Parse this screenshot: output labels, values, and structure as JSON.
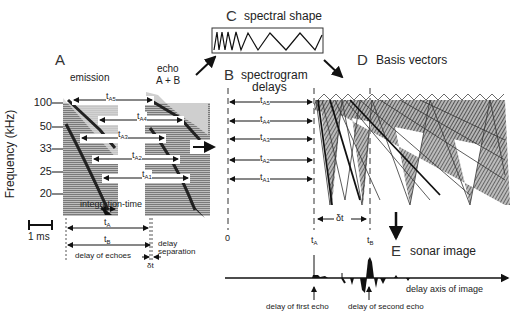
{
  "panels": {
    "A": {
      "letter": "A",
      "emission_label": "emission",
      "echo_label_1": "echo",
      "echo_label_2": "A + B",
      "y_axis_label": "Frequency (kHz)",
      "y_ticks": [
        "100",
        "50",
        "33",
        "25",
        "20"
      ],
      "delay_labels": [
        {
          "t": "t",
          "sub": "A5"
        },
        {
          "t": "t",
          "sub": "A4"
        },
        {
          "t": "t",
          "sub": "A3"
        },
        {
          "t": "t",
          "sub": "A2"
        },
        {
          "t": "t",
          "sub": "A1"
        }
      ],
      "integration_time": "integration-time",
      "scale_bar": "1 ms",
      "tA": {
        "t": "t",
        "sub": "A"
      },
      "tB": {
        "t": "t",
        "sub": "B"
      },
      "delay_of_echoes": "delay of echoes",
      "delay_separation_1": "delay",
      "delay_separation_2": "separation",
      "delta_t": "δt"
    },
    "B": {
      "letter": "B",
      "title_1": "spectrogram",
      "title_2": "delays",
      "delay_labels": [
        {
          "t": "t",
          "sub": "A5"
        },
        {
          "t": "t",
          "sub": "A4"
        },
        {
          "t": "t",
          "sub": "A3"
        },
        {
          "t": "t",
          "sub": "A2"
        },
        {
          "t": "t",
          "sub": "A1"
        }
      ],
      "zero": "0",
      "tA": {
        "t": "t",
        "sub": "A"
      },
      "tB": {
        "t": "t",
        "sub": "B"
      },
      "delta_t": "δt"
    },
    "C": {
      "letter": "C",
      "title": "spectral shape"
    },
    "D": {
      "letter": "D",
      "title": "Basis vectors"
    },
    "E": {
      "letter": "E",
      "title": "sonar image",
      "axis_label": "delay axis of image",
      "first_echo": "delay of first echo",
      "second_echo": "delay of second echo"
    }
  },
  "colors": {
    "ink": "#111111",
    "spectrogram_fill": "#9a9a9a",
    "spectrogram_dark": "#2a2a2a",
    "basis_fill": "#8c8c8c"
  }
}
